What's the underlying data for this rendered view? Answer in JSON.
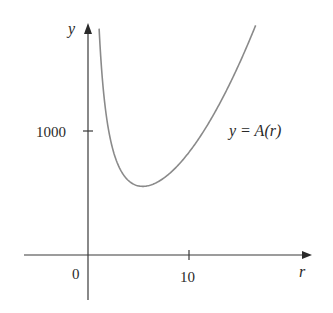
{
  "chart_data": {
    "type": "line",
    "title": "",
    "xlabel": "r",
    "ylabel": "y",
    "x_ticks": [
      {
        "value": 0,
        "label": "0"
      },
      {
        "value": 10,
        "label": "10"
      }
    ],
    "y_ticks": [
      {
        "value": 1000,
        "label": "1000"
      }
    ],
    "xlim": [
      -1.7,
      20
    ],
    "ylim": [
      -400,
      1860
    ],
    "grid": false,
    "legend": null,
    "annotations": [
      {
        "text": "y = A(r)",
        "x": 17.4,
        "y": 1000
      }
    ],
    "series": [
      {
        "name": "y = A(r)",
        "function": "A(r) = 2πr² + 2000/r",
        "x": [
          1.1,
          1.5,
          2,
          2.5,
          3,
          3.5,
          4,
          4.5,
          5,
          5.42,
          6,
          7,
          8,
          9,
          10,
          11,
          12,
          13,
          14,
          15,
          16,
          16.6
        ],
        "values": [
          1826,
          1347,
          1025,
          839,
          723,
          648,
          601,
          572,
          557,
          554,
          560,
          594,
          652,
          731,
          828,
          942,
          1071,
          1216,
          1374,
          1547,
          1733,
          1852
        ]
      }
    ]
  },
  "labels": {
    "y_axis": "y",
    "x_axis": "r",
    "origin": "0",
    "x_tick_10": "10",
    "y_tick_1000": "1000",
    "curve_label_prefix": "y = ",
    "curve_label_func": "A(r)"
  }
}
